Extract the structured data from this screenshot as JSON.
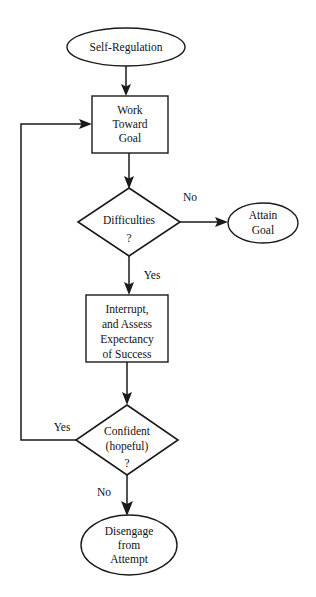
{
  "diagram": {
    "background_color": "#ffffff",
    "line_color": "#1a1a1a",
    "text_color": "#111111",
    "nodes": [
      {
        "id": "self-regulation",
        "shape": "ellipse",
        "lines": [
          "Self-Regulation"
        ],
        "cx": 126,
        "cy": 47,
        "rx": 59,
        "ry": 19
      },
      {
        "id": "work-toward-goal",
        "shape": "rectangle",
        "lines": [
          "Work",
          "Toward",
          "Goal"
        ],
        "x": 92,
        "y": 96,
        "width": 76,
        "height": 57
      },
      {
        "id": "difficulties",
        "shape": "diamond",
        "lines": [
          "Difficulties",
          "?"
        ],
        "cx": 129,
        "cy": 222,
        "rx": 51,
        "ry": 34
      },
      {
        "id": "attain-goal",
        "shape": "ellipse",
        "lines": [
          "Attain",
          "Goal"
        ],
        "cx": 263,
        "cy": 223,
        "rx": 35,
        "ry": 20
      },
      {
        "id": "interrupt-assess",
        "shape": "rectangle",
        "lines": [
          "Interrupt,",
          "and Assess",
          "Expectancy",
          "of Success"
        ],
        "x": 86,
        "y": 295,
        "width": 82,
        "height": 67
      },
      {
        "id": "confident-hopeful",
        "shape": "diamond",
        "lines": [
          "Confident",
          "(hopeful)",
          "?"
        ],
        "cx": 127,
        "cy": 440,
        "rx": 51,
        "ry": 35
      },
      {
        "id": "disengage-from-attempt",
        "shape": "ellipse",
        "lines": [
          "Disengage",
          "from",
          "Attempt"
        ],
        "cx": 129,
        "cy": 545,
        "rx": 48,
        "ry": 30
      }
    ],
    "edges": [
      {
        "id": "self-regulation-to-work",
        "from": "self-regulation",
        "to": "work-toward-goal",
        "label": ""
      },
      {
        "id": "work-to-difficulties",
        "from": "work-toward-goal",
        "to": "difficulties",
        "label": ""
      },
      {
        "id": "difficulties-no-to-attain",
        "from": "difficulties",
        "to": "attain-goal",
        "label": "No",
        "label_x": 190,
        "label_y": 201
      },
      {
        "id": "difficulties-yes-to-interrupt",
        "from": "difficulties",
        "to": "interrupt-assess",
        "label": "Yes",
        "label_x": 152,
        "label_y": 279
      },
      {
        "id": "interrupt-to-confident",
        "from": "interrupt-assess",
        "to": "confident-hopeful",
        "label": ""
      },
      {
        "id": "confident-yes-to-work",
        "from": "confident-hopeful",
        "to": "work-toward-goal",
        "label": "Yes",
        "label_x": 62,
        "label_y": 431
      },
      {
        "id": "confident-no-to-disengage",
        "from": "confident-hopeful",
        "to": "disengage-from-attempt",
        "label": "No",
        "label_x": 104,
        "label_y": 496
      }
    ]
  }
}
